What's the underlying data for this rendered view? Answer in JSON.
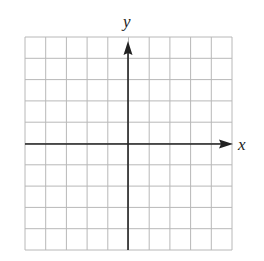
{
  "figure": {
    "type": "coordinate-grid",
    "x_label": "x",
    "y_label": "y",
    "grid": {
      "columns": 10,
      "rows": 10,
      "show_grid": true
    },
    "x_range": [
      -5,
      5
    ],
    "y_range": [
      -5,
      5
    ],
    "colors": {
      "grid": "#b8b8b8",
      "axis": "#222222",
      "background": "#ffffff"
    }
  }
}
